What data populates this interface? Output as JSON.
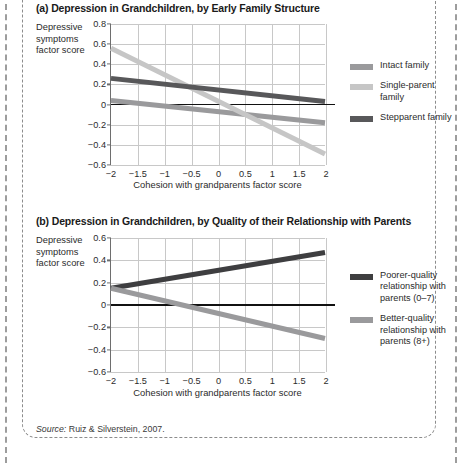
{
  "page": {
    "source_prefix": "Source:",
    "source_text": " Ruiz & Silverstein, 2007."
  },
  "colors": {
    "dark_gray": "#58585a",
    "medium_gray": "#9a9a9c",
    "light_gray": "#c6c6c6",
    "near_black": "#3e3e40",
    "axis": "#6e6e6e",
    "grid": "#c8c8c8",
    "zero": "#111111"
  },
  "panel_a": {
    "title": "(a) Depression in Grandchildren, by Early Family Structure",
    "y_caption_lines": [
      "Depressive",
      "symptoms",
      "factor score"
    ],
    "x_caption": "Cohesion with grandparents factor score",
    "legend": [
      {
        "label": "Intact family",
        "color": "#9a9a9c"
      },
      {
        "label": "Single-parent\nfamily",
        "color": "#c6c6c6"
      },
      {
        "label": "Stepparent family",
        "color": "#58585a"
      }
    ]
  },
  "panel_b": {
    "title": "(b) Depression in Grandchildren, by Quality of their Relationship with Parents",
    "y_caption_lines": [
      "Depressive",
      "symptoms",
      "factor score"
    ],
    "x_caption": "Cohesion with grandparents factor score",
    "legend": [
      {
        "label": "Poorer-quality\nrelationship with\nparents (0–7)",
        "color": "#3e3e40"
      },
      {
        "label": "Better-quality\nrelationship with\nparents (8+)",
        "color": "#9a9a9c"
      }
    ]
  },
  "chart_data": [
    {
      "type": "line",
      "id": "panel-a",
      "title": "(a) Depression in Grandchildren, by Early Family Structure",
      "xlabel": "Cohesion with grandparents factor score",
      "ylabel": "Depressive symptoms factor score",
      "xlim": [
        -2,
        2
      ],
      "ylim": [
        -0.6,
        0.8
      ],
      "xticks": [
        -2,
        -1.5,
        -1,
        -0.5,
        0,
        0.5,
        1,
        1.5,
        2
      ],
      "xticklabels": [
        "−2",
        "−1.5",
        "−1",
        "−0.5",
        "0",
        "0.5",
        "1",
        "1.5",
        "2"
      ],
      "yticks": [
        0.8,
        0.6,
        0.4,
        0.2,
        0,
        -0.2,
        -0.4,
        -0.6
      ],
      "yticklabels": [
        "0.8",
        "0.6",
        "0.4",
        "0.2",
        "0",
        "−0.2",
        "−0.4",
        "−0.6"
      ],
      "grid": true,
      "legend_position": "right",
      "x": [
        -2,
        2
      ],
      "series": [
        {
          "name": "Intact family",
          "color": "#9a9a9c",
          "values": [
            0.04,
            -0.18
          ]
        },
        {
          "name": "Single-parent family",
          "color": "#c6c6c6",
          "values": [
            0.56,
            -0.49
          ]
        },
        {
          "name": "Stepparent family",
          "color": "#58585a",
          "values": [
            0.26,
            0.03
          ]
        }
      ]
    },
    {
      "type": "line",
      "id": "panel-b",
      "title": "(b) Depression in Grandchildren, by Quality of their Relationship with Parents",
      "xlabel": "Cohesion with grandparents factor score",
      "ylabel": "Depressive symptoms factor score",
      "xlim": [
        -2,
        2
      ],
      "ylim": [
        -0.6,
        0.6
      ],
      "xticks": [
        -2,
        -1.5,
        -1,
        -0.5,
        0,
        0.5,
        1,
        1.5,
        2
      ],
      "xticklabels": [
        "−2",
        "−1.5",
        "−1",
        "−0.5",
        "0",
        "0.5",
        "1",
        "1.5",
        "2"
      ],
      "yticks": [
        0.6,
        0.4,
        0.2,
        0,
        -0.2,
        -0.4,
        -0.6
      ],
      "yticklabels": [
        "0.6",
        "0.4",
        "0.2",
        "0",
        "−0.2",
        "−0.4",
        "−0.6"
      ],
      "grid": true,
      "legend_position": "right",
      "x": [
        -2,
        2
      ],
      "series": [
        {
          "name": "Poorer-quality relationship with parents (0–7)",
          "color": "#3e3e40",
          "values": [
            0.15,
            0.47
          ]
        },
        {
          "name": "Better-quality relationship with parents (8+)",
          "color": "#9a9a9c",
          "values": [
            0.15,
            -0.3
          ]
        }
      ]
    }
  ]
}
